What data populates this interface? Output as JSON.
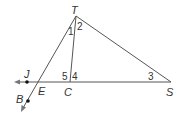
{
  "diagram": {
    "points": [
      {
        "id": "T",
        "label": "T"
      },
      {
        "id": "S",
        "label": "S"
      },
      {
        "id": "C",
        "label": "C"
      },
      {
        "id": "E",
        "label": "E"
      },
      {
        "id": "J",
        "label": "J"
      },
      {
        "id": "B",
        "label": "B"
      }
    ],
    "angles": [
      {
        "id": "a1",
        "label": "1"
      },
      {
        "id": "a2",
        "label": "2"
      },
      {
        "id": "a3",
        "label": "3"
      },
      {
        "id": "a4",
        "label": "4"
      },
      {
        "id": "a5",
        "label": "5"
      }
    ],
    "segments": [
      "TS",
      "TC",
      "CS",
      "TE",
      "EJ"
    ],
    "rays": [
      "EJ",
      "EB"
    ],
    "marked_points": [
      "J",
      "B"
    ],
    "colors": {
      "line": "#555555",
      "text": "#333333",
      "dot": "#111111"
    }
  }
}
